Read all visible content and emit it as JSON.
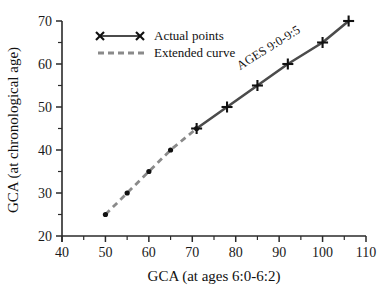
{
  "chart_data": {
    "type": "line",
    "title": "",
    "xlabel": "GCA (at ages 6:0-6:2)",
    "ylabel": "GCA (at chronological age)",
    "xlim": [
      40,
      110
    ],
    "ylim": [
      20,
      70
    ],
    "xticks": [
      40,
      50,
      60,
      70,
      80,
      90,
      100,
      110
    ],
    "yticks": [
      20,
      30,
      40,
      50,
      60,
      70
    ],
    "x_minor_step": 5,
    "y_minor_step": 5,
    "grid": false,
    "legend_position": "top-left",
    "annotations": [
      {
        "text": "AGES 9:0-9:5",
        "x": 88,
        "y": 63,
        "rotation": -32
      }
    ],
    "series": [
      {
        "name": "Extended curve",
        "style": "dashed",
        "marker": "dot",
        "color": "#8a8a8a",
        "x": [
          50,
          55,
          60,
          65,
          71
        ],
        "y": [
          25,
          30,
          35,
          40,
          45
        ]
      },
      {
        "name": "Actual points",
        "style": "solid",
        "marker": "cross",
        "color": "#4b4b4b",
        "x": [
          71,
          78,
          85,
          92,
          100,
          106
        ],
        "y": [
          45,
          50,
          55,
          60,
          65,
          70
        ]
      }
    ]
  },
  "legend": {
    "items": [
      {
        "label": "Actual points",
        "style": "solid",
        "marker": "x"
      },
      {
        "label": "Extended curve",
        "style": "dashed",
        "marker": "none"
      }
    ]
  },
  "axes": {
    "x_title": "GCA (at ages 6:0-6:2)",
    "y_title": "GCA (at chronological age)",
    "x_tick_labels": [
      "40",
      "50",
      "60",
      "70",
      "80",
      "90",
      "100",
      "110"
    ],
    "y_tick_labels": [
      "20",
      "30",
      "40",
      "50",
      "60",
      "70"
    ]
  },
  "annotation": {
    "ages_label": "AGES 9:0-9:5"
  }
}
